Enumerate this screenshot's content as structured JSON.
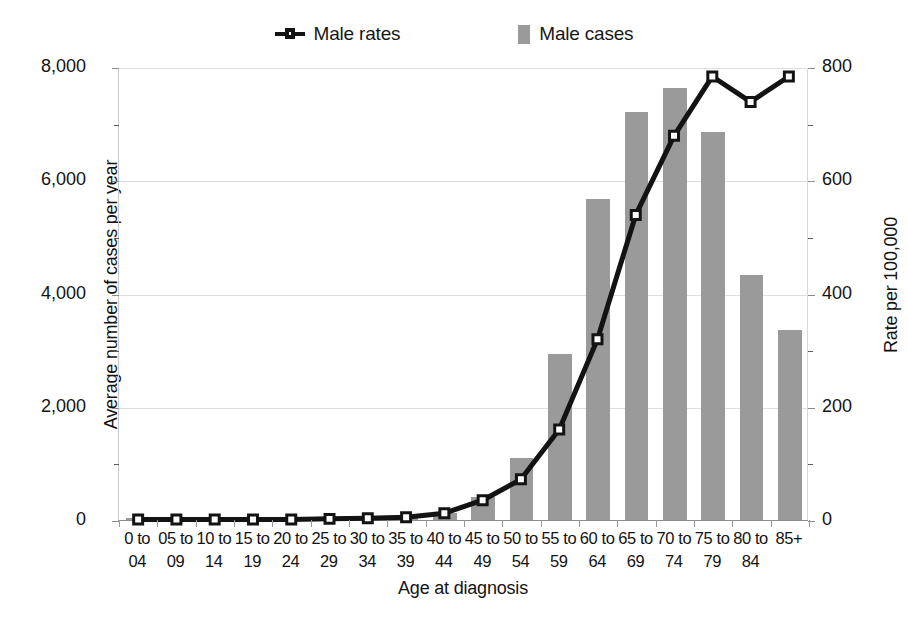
{
  "legend": {
    "entries": [
      {
        "label": "Male rates",
        "marker": "line-marker-icon",
        "color": "#131313"
      },
      {
        "label": "Male cases",
        "marker": "square-swatch-icon",
        "color": "#9a9a9a"
      }
    ]
  },
  "axes": {
    "y_left_title": "Average number of cases per year",
    "y_right_title": "Rate per 100,000",
    "x_title": "Age at diagnosis",
    "y_left_ticks": [
      "0",
      "2,000",
      "4,000",
      "6,000",
      "8,000"
    ],
    "y_right_ticks": [
      "0",
      "200",
      "400",
      "600",
      "800"
    ]
  },
  "chart_data": {
    "type": "bar",
    "title": "",
    "subtitle": "",
    "xlabel": "Age at diagnosis",
    "ylabel": "Average number of cases per year",
    "y2label": "Rate per 100,000",
    "ylim": [
      0,
      8000
    ],
    "y2lim": [
      0,
      800
    ],
    "grid": true,
    "legend_position": "top",
    "categories": [
      "0 to 04",
      "05 to 09",
      "10 to 14",
      "15 to 19",
      "20 to 24",
      "25 to 29",
      "30 to 34",
      "35 to 39",
      "40 to 44",
      "45 to 49",
      "50 to 54",
      "55 to 59",
      "60 to 64",
      "65 to 69",
      "70 to 74",
      "75 to 79",
      "80 to 84",
      "85+"
    ],
    "categories_line1": [
      "0 to",
      "05 to",
      "10 to",
      "15 to",
      "20 to",
      "25 to",
      "30 to",
      "35 to",
      "40 to",
      "45 to",
      "50 to",
      "55 to",
      "60 to",
      "65 to",
      "70 to",
      "75 to",
      "80 to",
      "85+"
    ],
    "categories_line2": [
      "04",
      "09",
      "14",
      "19",
      "24",
      "29",
      "34",
      "39",
      "44",
      "49",
      "54",
      "59",
      "64",
      "69",
      "74",
      "79",
      "84",
      ""
    ],
    "series": [
      {
        "name": "Male cases",
        "axis": "left",
        "kind": "bar",
        "color": "#9a9a9a",
        "values": [
          20,
          20,
          20,
          20,
          25,
          30,
          40,
          60,
          120,
          410,
          1100,
          2940,
          5670,
          7200,
          7630,
          6850,
          4330,
          3350
        ]
      },
      {
        "name": "Male rates",
        "axis": "right",
        "kind": "line",
        "color": "#131313",
        "values": [
          1,
          1,
          1,
          1,
          1,
          2,
          3,
          5,
          12,
          35,
          72,
          160,
          320,
          540,
          680,
          785,
          740,
          785
        ]
      }
    ]
  }
}
